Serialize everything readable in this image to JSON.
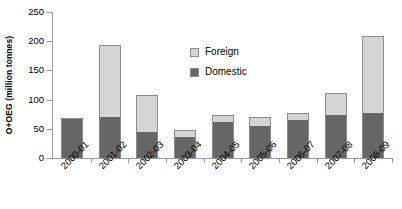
{
  "chart_data": {
    "type": "bar",
    "stacked": true,
    "title": "",
    "xlabel": "",
    "ylabel": "O+OEG (million tonnes)",
    "ylim": [
      0,
      250
    ],
    "ytick_step": 50,
    "yticks": [
      0,
      50,
      100,
      150,
      200,
      250
    ],
    "grid": false,
    "legend_position": "inside-upper-center",
    "categories": [
      "2000-01",
      "2001-02",
      "2002-03",
      "2003-04",
      "2004-05",
      "2005-06",
      "2006-07",
      "2007-08",
      "2008-09"
    ],
    "series": [
      {
        "name": "Domestic",
        "color": "#666666",
        "values": [
          68,
          70,
          45,
          36,
          62,
          55,
          65,
          74,
          77
        ]
      },
      {
        "name": "Foreign",
        "color": "#d5d5d5",
        "values": [
          0,
          123,
          63,
          12,
          12,
          15,
          12,
          38,
          132
        ]
      }
    ],
    "totals": [
      68,
      193,
      108,
      48,
      74,
      70,
      77,
      112,
      209
    ]
  },
  "legend": {
    "items": [
      {
        "label": "Foreign",
        "color": "#d5d5d5"
      },
      {
        "label": "Domestic",
        "color": "#666666"
      }
    ]
  },
  "axis": {
    "y_title": "O+OEG (million tonnes)"
  }
}
